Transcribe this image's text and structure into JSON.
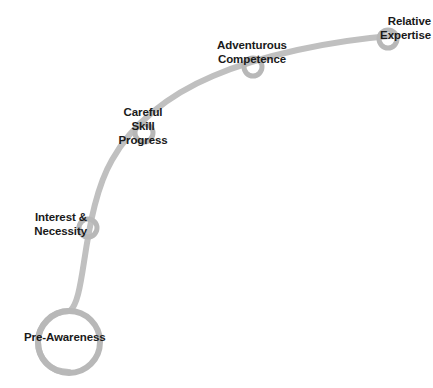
{
  "diagram": {
    "type": "curve-milestone-diagram",
    "colors": {
      "curve": "#c0c0c0",
      "node_ring": "#b8b8b8",
      "label_text": "#1a1a1a",
      "background": "#ffffff"
    },
    "curve": {
      "stroke_width": 6,
      "path": "M 69 372 C 48 372 38 357 38 342 C 38 327 51 311 70 311 C 77 305 80 288 84 262 C 90 222 97 186 112 160 C 132 124 168 95 213 76 C 262 55 330 41 390 36"
    },
    "nodes": [
      {
        "id": "pre-awareness",
        "label": "Pre-Awareness",
        "label_lines": [
          "Pre-Awareness"
        ],
        "align": "left",
        "cx": 69,
        "cy": 342,
        "r": 31,
        "ring_width": 6,
        "label_x": 24,
        "label_y": 330,
        "label_width": 92
      },
      {
        "id": "interest-necessity",
        "label": "Interest & Necessity",
        "label_lines": [
          "Interest &",
          "Necessity"
        ],
        "align": "right",
        "cx": 88,
        "cy": 228,
        "r": 9,
        "ring_width": 5,
        "label_x": 0,
        "label_y": 210,
        "label_width": 87
      },
      {
        "id": "careful-skill-progress",
        "label": "Careful Skill Progress",
        "label_lines": [
          "Careful",
          "Skill",
          "Progress"
        ],
        "align": "center",
        "cx": 144,
        "cy": 133,
        "r": 9,
        "ring_width": 5,
        "label_x": 103,
        "label_y": 105,
        "label_width": 80
      },
      {
        "id": "adventurous-competence",
        "label": "Adventurous Competence",
        "label_lines": [
          "Adventurous",
          "Competence"
        ],
        "align": "center",
        "cx": 253,
        "cy": 67,
        "r": 9,
        "ring_width": 5,
        "label_x": 195,
        "label_y": 38,
        "label_width": 114
      },
      {
        "id": "relative-expertise",
        "label": "Relative Expertise",
        "label_lines": [
          "Relative",
          "Expertise"
        ],
        "align": "right",
        "cx": 388,
        "cy": 39,
        "r": 9,
        "ring_width": 5,
        "label_x": 355,
        "label_y": 14,
        "label_width": 76
      }
    ]
  }
}
